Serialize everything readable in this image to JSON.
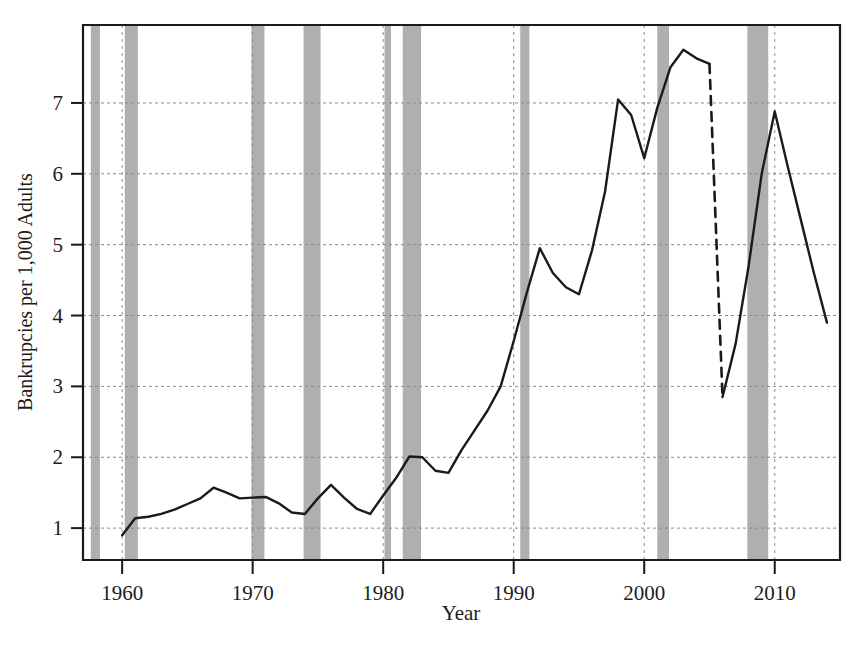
{
  "chart_data": {
    "type": "line",
    "title": "",
    "xlabel": "Year",
    "ylabel": "Bankrupcies per 1,000 Adults",
    "xlim": [
      1957,
      2015
    ],
    "ylim": [
      0.55,
      8.1
    ],
    "grid": true,
    "legend": null,
    "xticks": [
      1960,
      1970,
      1980,
      1990,
      2000,
      2010
    ],
    "xtick_labels": [
      "1960",
      "1970",
      "1980",
      "1990",
      "2000",
      "2010"
    ],
    "yticks": [
      1,
      2,
      3,
      4,
      5,
      6,
      7
    ],
    "ytick_labels": [
      "1",
      "2",
      "3",
      "4",
      "5",
      "6",
      "7"
    ],
    "line_color": "#1a1a1a",
    "band_color": "#9e9e9e",
    "grid_color": "#8a8a8a",
    "series": [
      {
        "name": "Bankruptcy filings (solid)",
        "style": "solid",
        "x": [
          1960,
          1961,
          1962,
          1963,
          1964,
          1965,
          1966,
          1967,
          1968,
          1969,
          1970,
          1971,
          1972,
          1973,
          1974,
          1975,
          1976,
          1977,
          1978,
          1979,
          1980,
          1981,
          1982,
          1983,
          1984,
          1985,
          1986,
          1987,
          1988,
          1989,
          1990,
          1991,
          1992,
          1993,
          1994,
          1995,
          1996,
          1997,
          1998,
          1999,
          2000,
          2001,
          2002,
          2003,
          2004,
          2005
        ],
        "y": [
          0.9,
          1.14,
          1.16,
          1.2,
          1.26,
          1.34,
          1.42,
          1.57,
          1.5,
          1.42,
          1.43,
          1.44,
          1.35,
          1.22,
          1.2,
          1.42,
          1.61,
          1.43,
          1.27,
          1.2,
          1.46,
          1.71,
          2.01,
          2.0,
          1.81,
          1.78,
          2.1,
          2.38,
          2.66,
          3.0,
          3.64,
          4.32,
          4.95,
          4.6,
          4.4,
          4.3,
          4.92,
          5.75,
          7.05,
          6.83,
          6.22,
          6.93,
          7.5,
          7.75,
          7.63,
          7.55
        ]
      },
      {
        "name": "Break (dashed, BAPCPA transition)",
        "style": "dashed",
        "x": [
          2005,
          2006
        ],
        "y": [
          7.55,
          2.85
        ]
      },
      {
        "name": "Bankruptcy filings post-2005 (solid)",
        "style": "solid",
        "x": [
          2006,
          2007,
          2008,
          2009,
          2010,
          2011,
          2012,
          2013,
          2014
        ],
        "y": [
          2.85,
          3.6,
          4.7,
          6.0,
          6.88,
          6.1,
          5.35,
          4.6,
          3.9
        ]
      }
    ],
    "recession_bands": [
      {
        "start": 1957.6,
        "end": 1958.3,
        "label": "1957-58"
      },
      {
        "start": 1960.2,
        "end": 1961.2,
        "label": "1960-61"
      },
      {
        "start": 1969.9,
        "end": 1970.9,
        "label": "1969-70"
      },
      {
        "start": 1973.9,
        "end": 1975.2,
        "label": "1973-75"
      },
      {
        "start": 1980.1,
        "end": 1980.6,
        "label": "1980"
      },
      {
        "start": 1981.5,
        "end": 1982.9,
        "label": "1981-82"
      },
      {
        "start": 1990.5,
        "end": 1991.2,
        "label": "1990-91"
      },
      {
        "start": 2001.0,
        "end": 2001.9,
        "label": "2001"
      },
      {
        "start": 2007.9,
        "end": 2009.5,
        "label": "2007-09"
      }
    ]
  },
  "axis": {
    "x_title": "Year",
    "y_title": "Bankrupcies per 1,000 Adults"
  }
}
